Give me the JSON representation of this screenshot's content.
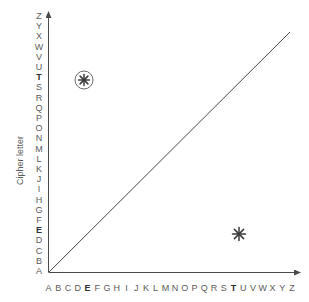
{
  "figure": {
    "type": "scatter-with-reference-line",
    "background_color": "#ffffff",
    "axis_color": "#4a4a4a",
    "label_color": "#5b5b5b",
    "emphasis_color": "#2f2f2f"
  },
  "axes": {
    "y_title": "Cipher letter",
    "x_title": "",
    "x_tick_labels": [
      "A",
      "B",
      "C",
      "D",
      "E",
      "F",
      "G",
      "H",
      "I",
      "J",
      "K",
      "L",
      "M",
      "N",
      "O",
      "P",
      "Q",
      "R",
      "S",
      "T",
      "U",
      "V",
      "W",
      "X",
      "Y",
      "Z"
    ],
    "y_tick_labels": [
      "A",
      "B",
      "C",
      "D",
      "E",
      "F",
      "G",
      "H",
      "I",
      "J",
      "K",
      "L",
      "M",
      "N",
      "O",
      "P",
      "Q",
      "R",
      "S",
      "T",
      "U",
      "V",
      "W",
      "X",
      "Y",
      "Z"
    ],
    "x_emphasized_ticks": [
      "E",
      "T"
    ],
    "y_emphasized_ticks": [
      "E",
      "T"
    ],
    "x_arrow": true,
    "y_arrow": true,
    "grid": false
  },
  "chart_data": {
    "type": "scatter",
    "title": "",
    "xlabel": "",
    "ylabel": "Cipher letter",
    "grid": false,
    "legend": null,
    "x": [
      "A",
      "B",
      "C",
      "D",
      "E",
      "F",
      "G",
      "H",
      "I",
      "J",
      "K",
      "L",
      "M",
      "N",
      "O",
      "P",
      "Q",
      "R",
      "S",
      "T",
      "U",
      "V",
      "W",
      "X",
      "Y",
      "Z"
    ],
    "xlim": [
      "A",
      "Z"
    ],
    "ylim": [
      "A",
      "Z"
    ],
    "categories": [
      "A",
      "B",
      "C",
      "D",
      "E",
      "F",
      "G",
      "H",
      "I",
      "J",
      "K",
      "L",
      "M",
      "N",
      "O",
      "P",
      "Q",
      "R",
      "S",
      "T",
      "U",
      "V",
      "W",
      "X",
      "Y",
      "Z"
    ],
    "series": [
      {
        "name": "marked points",
        "marker": "asterisk",
        "points": [
          {
            "x": "E",
            "y": "T",
            "x_index": 4,
            "y_index": 19,
            "marker": "asterisk",
            "circled": true,
            "label": ""
          },
          {
            "x": "T",
            "y": "E",
            "x_index": 19,
            "y_index": 4,
            "marker": "asterisk",
            "circled": false,
            "label": ""
          }
        ]
      }
    ],
    "reference_line": {
      "name": "identity line",
      "from": {
        "x": "A",
        "y": "A"
      },
      "to": {
        "x": "Z",
        "y": "Z"
      },
      "style": "solid",
      "color": "#4a4a4a"
    }
  },
  "markers": [
    {
      "name": "circled-asterisk-marker",
      "x_letter": "E",
      "y_letter": "T",
      "circled": true
    },
    {
      "name": "asterisk-marker",
      "x_letter": "T",
      "y_letter": "E",
      "circled": false
    }
  ]
}
